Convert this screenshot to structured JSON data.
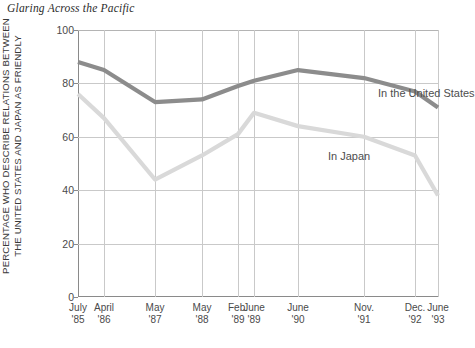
{
  "title": "Glaring Across the Pacific",
  "axis": {
    "y_label_line1": "PERCENTAGE WHO DESCRIBE RELATIONS BETWEEN",
    "y_label_line2": "THE UNITED STATES AND JAPAN AS FRIENDLY"
  },
  "colors": {
    "us_line": "#8c8c8c",
    "japan_line": "#d9d9d9",
    "axis": "#8a8a8a",
    "grid": "#c9c9c9",
    "text": "#3a3a3a"
  },
  "chart_data": {
    "type": "line",
    "title": "Glaring Across the Pacific",
    "xlabel": "",
    "ylabel": "PERCENTAGE WHO DESCRIBE RELATIONS BETWEEN THE UNITED STATES AND JAPAN AS FRIENDLY",
    "ylim": [
      0,
      100
    ],
    "yticks": [
      0,
      20,
      40,
      60,
      80,
      100
    ],
    "ytick_labels": [
      "0",
      "20",
      "40",
      "60",
      "80",
      "100"
    ],
    "grid": true,
    "legend": "inline-labels",
    "categories": [
      "July '85",
      "April '86",
      "May '87",
      "May '88",
      "Feb. '89",
      "June '89",
      "June '90",
      "Nov. '91",
      "Dec. '92",
      "June '93"
    ],
    "category_lines": [
      [
        "July",
        "'85"
      ],
      [
        "April",
        "'86"
      ],
      [
        "May",
        "'87"
      ],
      [
        "May",
        "'88"
      ],
      [
        "Feb.",
        "'89"
      ],
      [
        "June",
        "'89"
      ],
      [
        "June",
        "'90"
      ],
      [
        "Nov.",
        "'91"
      ],
      [
        "Dec.",
        "'92"
      ],
      [
        "June",
        "'93"
      ]
    ],
    "x_positions": [
      0,
      26,
      77,
      124,
      160,
      176,
      220,
      286,
      337,
      360
    ],
    "series": [
      {
        "name": "In the United States",
        "color": "#8c8c8c",
        "values": [
          88,
          85,
          73,
          74,
          79,
          81,
          85,
          82,
          77,
          71
        ],
        "label_x": 300,
        "label_y": 57
      },
      {
        "name": "In Japan",
        "color": "#d9d9d9",
        "values": [
          76,
          67,
          44,
          53,
          61,
          69,
          64,
          60,
          53,
          38
        ],
        "label_x": 250,
        "label_y": 120
      }
    ]
  }
}
